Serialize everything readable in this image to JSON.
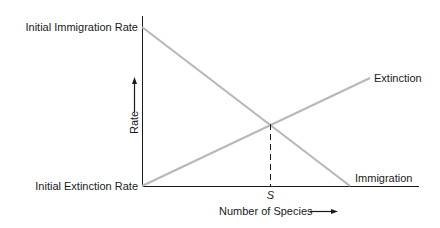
{
  "diagram": {
    "y_axis": {
      "label": "Rate",
      "top_label": "Initial Immigration Rate",
      "bottom_label": "Initial Extinction Rate"
    },
    "x_axis": {
      "label": "Number of Species",
      "equilibrium_marker": "S"
    },
    "curves": [
      {
        "name": "Immigration",
        "label": "Immigration",
        "from": [
          142,
          27
        ],
        "to": [
          350,
          186
        ],
        "color": "#b8b8b8"
      },
      {
        "name": "Extinction",
        "label": "Extinction",
        "from": [
          142,
          186
        ],
        "to": [
          370,
          78
        ],
        "color": "#b8b8b8"
      }
    ],
    "intersection": [
      270,
      124
    ],
    "colors": {
      "axis": "#1a1a1a",
      "curve": "#b8b8b8",
      "text": "#1a1a1a"
    }
  }
}
